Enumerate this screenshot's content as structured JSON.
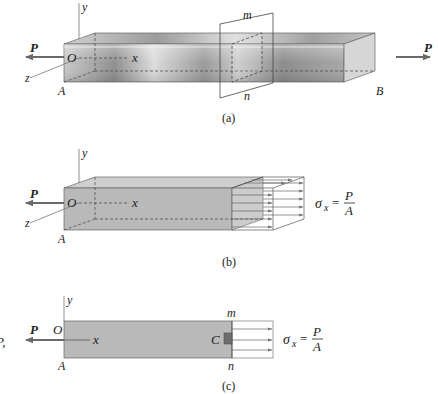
{
  "figure": {
    "panels": [
      {
        "id": "a",
        "caption": "(a)",
        "labels": {
          "y": "y",
          "O": "O",
          "x": "x",
          "z": "z",
          "A": "A",
          "B": "B",
          "P_left": "P",
          "P_right": "P",
          "m": "m",
          "n": "n"
        }
      },
      {
        "id": "b",
        "caption": "(b)",
        "labels": {
          "y": "y",
          "O": "O",
          "x": "x",
          "z": "z",
          "A": "A",
          "P_left": "P"
        },
        "formula": {
          "lhs": "σ",
          "sub": "x",
          "eq": "=",
          "num": "P",
          "den": "A"
        }
      },
      {
        "id": "c",
        "caption": "(c)",
        "labels": {
          "y": "y",
          "O": "O",
          "x": "x",
          "A": "A",
          "P_left": "P",
          "m": "m",
          "n": "n",
          "C": "C",
          "edge_fragment": "P,"
        },
        "formula": {
          "lhs": "σ",
          "sub": "x",
          "eq": "=",
          "num": "P",
          "den": "A"
        }
      }
    ],
    "colors": {
      "bar_metal_light": "#e6e6e6",
      "bar_metal_dark": "#8a8a8a",
      "bar_gray": "#b8b8b8",
      "bar_gray_top": "#cfcfcf",
      "edge": "#555555",
      "arrow": "#666666",
      "element_C": "#6e6e6e"
    }
  }
}
